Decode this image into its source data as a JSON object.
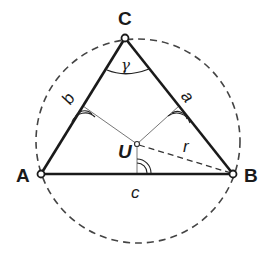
{
  "figure": {
    "vertices": {
      "A": {
        "label": "A",
        "x": 41,
        "y": 174
      },
      "B": {
        "label": "B",
        "x": 233,
        "y": 174
      },
      "C": {
        "label": "C",
        "x": 125,
        "y": 38
      }
    },
    "sides": {
      "a": {
        "label": "a"
      },
      "b": {
        "label": "b"
      },
      "c": {
        "label": "c"
      }
    },
    "circumcenter": {
      "label": "U",
      "x": 137,
      "y": 144
    },
    "radius": {
      "label": "r"
    },
    "angle_at_C": {
      "label": "γ"
    },
    "circumcircle": {
      "cx": 138,
      "cy": 141,
      "r": 102,
      "style": "dashed"
    },
    "colors": {
      "stroke": "#1a1a1a",
      "thin": "#555555",
      "dashed": "#444444"
    }
  }
}
